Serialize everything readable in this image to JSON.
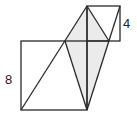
{
  "diagram": {
    "large_square": {
      "side_label": "8"
    },
    "small_square": {
      "side_label": "4"
    },
    "colors": {
      "stroke": "#2a2a2a",
      "shade": "#ebebeb",
      "background": "#ffffff"
    }
  }
}
